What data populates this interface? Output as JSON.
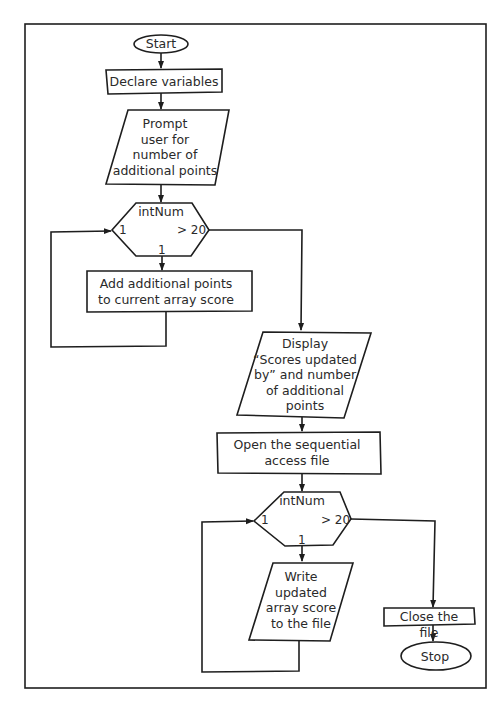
{
  "nodes": {
    "start": {
      "label": "Start",
      "shape": "terminal"
    },
    "declare": {
      "label": "Declare variables",
      "shape": "process"
    },
    "prompt": {
      "label": "Prompt\nuser for\nnumber of\nadditional points",
      "shape": "input-output"
    },
    "loop1": {
      "label": "intNum",
      "shape": "loop-hexagon",
      "start_label": "1",
      "end_label": "> 20",
      "step_label": "1"
    },
    "add": {
      "label": "Add additional points\nto current array score",
      "shape": "process"
    },
    "display": {
      "label": "Display\n“Scores updated\nby” and number\nof additional\npoints",
      "shape": "input-output"
    },
    "open": {
      "label": "Open the sequential\naccess file",
      "shape": "process"
    },
    "loop2": {
      "label": "intNum",
      "shape": "loop-hexagon",
      "start_label": "1",
      "end_label": "> 20",
      "step_label": "1"
    },
    "write": {
      "label": "Write\nupdated\narray score\nto the file",
      "shape": "input-output"
    },
    "close": {
      "label": "Close the file",
      "shape": "process"
    },
    "stop": {
      "label": "Stop",
      "shape": "terminal"
    }
  },
  "edges": [
    [
      "start",
      "declare"
    ],
    [
      "declare",
      "prompt"
    ],
    [
      "prompt",
      "loop1"
    ],
    [
      "loop1",
      "add"
    ],
    [
      "add",
      "loop1"
    ],
    [
      "loop1",
      "display"
    ],
    [
      "display",
      "open"
    ],
    [
      "open",
      "loop2"
    ],
    [
      "loop2",
      "write"
    ],
    [
      "write",
      "loop2"
    ],
    [
      "loop2",
      "close"
    ],
    [
      "close",
      "stop"
    ]
  ],
  "colors": {
    "stroke": "#1e1e1e",
    "text": "#2a2a2a",
    "background": "#ffffff"
  }
}
